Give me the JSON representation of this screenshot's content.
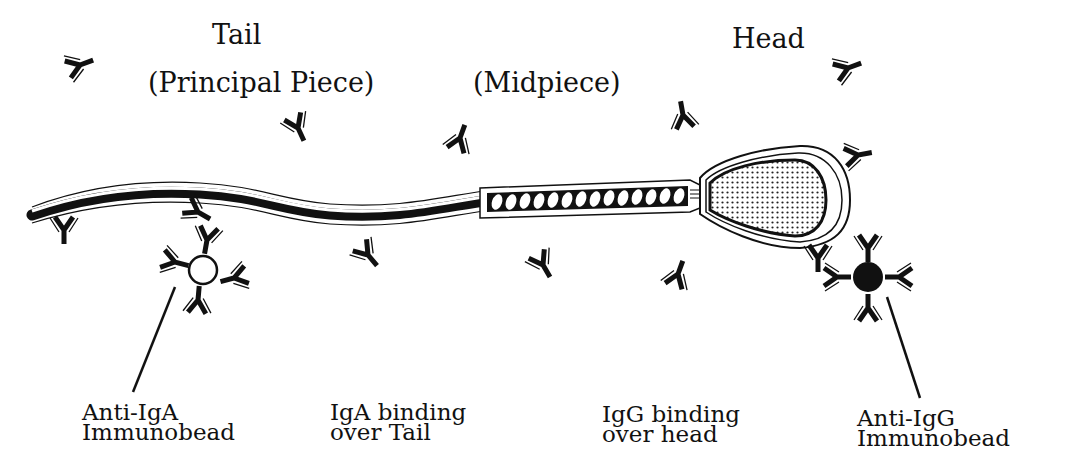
{
  "diagram": {
    "type": "sperm-immunobead-binding-illustration",
    "colors": {
      "ink": "#111111",
      "background": "#ffffff",
      "head_stipple": "#cfcfcf"
    },
    "top_labels": {
      "tail": "Tail",
      "principal_piece": "(Principal Piece)",
      "midpiece": "(Midpiece)",
      "head": "Head"
    },
    "bottom_labels": {
      "anti_iga": {
        "line1": "Anti-IgA",
        "line2": "Immunobead"
      },
      "iga_binding": {
        "line1": "IgA binding",
        "line2": "over Tail"
      },
      "igg_binding": {
        "line1": "IgG binding",
        "line2": "over head"
      },
      "anti_igg": {
        "line1": "Anti-IgG",
        "line2": "Immunobead"
      }
    },
    "parts": [
      "head",
      "midpiece",
      "principal-piece-tail"
    ],
    "beads": [
      {
        "name": "anti-IgA immunobead",
        "fill": "white",
        "bound_to": "tail"
      },
      {
        "name": "anti-IgG immunobead",
        "fill": "black",
        "bound_to": "head"
      }
    ]
  }
}
